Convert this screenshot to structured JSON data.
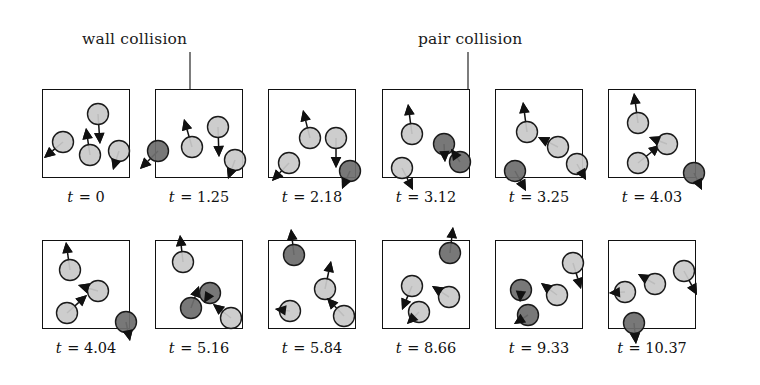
{
  "figure": {
    "type": "simulation-snapshot-sequence",
    "rows": 2,
    "columns": 6,
    "box": {
      "width": 88,
      "height": 89,
      "border_color": "#111111",
      "border_width": 1.6
    },
    "particle": {
      "radius": 10.5,
      "normal_fill": "#c9c9c9",
      "collision_fill": "#6e6e6e",
      "outline_color": "#1a1a1a",
      "outline_width": 1.4,
      "arrow_color": "#111111"
    }
  },
  "annotations": [
    {
      "id": "wall-collision",
      "label": "wall collision",
      "x": 82,
      "y": 30,
      "leader_x": 190,
      "leader_y_top": 52,
      "leader_y_bottom": 112
    },
    {
      "id": "pair-collision",
      "label": "pair collision",
      "x": 418,
      "y": 30,
      "leader_x": 468,
      "leader_y_top": 52,
      "leader_y_bottom": 142
    }
  ],
  "panels": [
    {
      "id": "panel-1",
      "time_label": "t = 0",
      "time_prefix": "t",
      "time_value": "= 0",
      "x": 42,
      "y": 89,
      "particles": [
        {
          "cx": 21,
          "cy": 53,
          "state": "normal",
          "arrow": {
            "dx": -19,
            "dy": 16
          }
        },
        {
          "cx": 48,
          "cy": 66,
          "state": "normal",
          "arrow": {
            "dx": -4,
            "dy": -27
          }
        },
        {
          "cx": 77,
          "cy": 62,
          "state": "normal",
          "arrow": {
            "dx": -6,
            "dy": 19
          }
        },
        {
          "cx": 56,
          "cy": 25,
          "state": "normal",
          "arrow": {
            "dx": 2,
            "dy": 30
          }
        }
      ]
    },
    {
      "id": "panel-2",
      "time_label": "t = 1.25",
      "time_prefix": "t",
      "time_value": "= 1.25",
      "x": 155,
      "y": 89,
      "particles": [
        {
          "cx": 3,
          "cy": 62,
          "state": "collision",
          "arrow": {
            "dx": -18,
            "dy": 18
          }
        },
        {
          "cx": 37,
          "cy": 58,
          "state": "normal",
          "arrow": {
            "dx": -8,
            "dy": -28
          }
        },
        {
          "cx": 63,
          "cy": 38,
          "state": "normal",
          "arrow": {
            "dx": 1,
            "dy": 30
          }
        },
        {
          "cx": 80,
          "cy": 71,
          "state": "normal",
          "arrow": {
            "dx": -7,
            "dy": 19
          }
        }
      ]
    },
    {
      "id": "panel-3",
      "time_label": "t = 2.18",
      "time_prefix": "t",
      "time_value": "= 2.18",
      "x": 268,
      "y": 89,
      "particles": [
        {
          "cx": 21,
          "cy": 74,
          "state": "normal",
          "arrow": {
            "dx": -17,
            "dy": 18
          }
        },
        {
          "cx": 42,
          "cy": 49,
          "state": "normal",
          "arrow": {
            "dx": -7,
            "dy": -28
          }
        },
        {
          "cx": 68,
          "cy": 49,
          "state": "normal",
          "arrow": {
            "dx": 0,
            "dy": 30
          }
        },
        {
          "cx": 82,
          "cy": 82,
          "state": "collision",
          "arrow": {
            "dx": -8,
            "dy": 18
          }
        }
      ]
    },
    {
      "id": "panel-4",
      "time_label": "t = 3.12",
      "time_prefix": "t",
      "time_value": "= 3.12",
      "x": 382,
      "y": 89,
      "particles": [
        {
          "cx": 30,
          "cy": 45,
          "state": "normal",
          "arrow": {
            "dx": -4,
            "dy": -30
          }
        },
        {
          "cx": 20,
          "cy": 79,
          "state": "normal",
          "arrow": {
            "dx": 11,
            "dy": 22
          }
        },
        {
          "cx": 62,
          "cy": 55,
          "state": "collision",
          "arrow": {
            "dx": 1,
            "dy": 18
          }
        },
        {
          "cx": 78,
          "cy": 73,
          "state": "collision",
          "arrow": {
            "dx": -9,
            "dy": -13
          }
        }
      ]
    },
    {
      "id": "panel-5",
      "time_label": "t = 3.25",
      "time_prefix": "t",
      "time_value": "= 3.25",
      "x": 495,
      "y": 89,
      "particles": [
        {
          "cx": 32,
          "cy": 43,
          "state": "normal",
          "arrow": {
            "dx": -4,
            "dy": -30
          }
        },
        {
          "cx": 20,
          "cy": 82,
          "state": "collision",
          "arrow": {
            "dx": 11,
            "dy": 20
          }
        },
        {
          "cx": 63,
          "cy": 58,
          "state": "normal",
          "arrow": {
            "dx": -20,
            "dy": -10
          }
        },
        {
          "cx": 82,
          "cy": 75,
          "state": "normal",
          "arrow": {
            "dx": 9,
            "dy": 16
          }
        }
      ]
    },
    {
      "id": "panel-6",
      "time_label": "t = 4.03",
      "time_prefix": "t",
      "time_value": "= 4.03",
      "x": 608,
      "y": 89,
      "particles": [
        {
          "cx": 30,
          "cy": 34,
          "state": "normal",
          "arrow": {
            "dx": -4,
            "dy": -30
          }
        },
        {
          "cx": 30,
          "cy": 74,
          "state": "normal",
          "arrow": {
            "dx": 22,
            "dy": -18
          }
        },
        {
          "cx": 59,
          "cy": 55,
          "state": "normal",
          "arrow": {
            "dx": -18,
            "dy": -7
          }
        },
        {
          "cx": 86,
          "cy": 84,
          "state": "collision",
          "arrow": {
            "dx": 8,
            "dy": 17
          }
        }
      ]
    },
    {
      "id": "panel-7",
      "time_label": "t = 4.04",
      "time_prefix": "t",
      "time_value": "= 4.04",
      "x": 42,
      "y": 240,
      "particles": [
        {
          "cx": 28,
          "cy": 30,
          "state": "normal",
          "arrow": {
            "dx": -4,
            "dy": -28
          }
        },
        {
          "cx": 25,
          "cy": 73,
          "state": "normal",
          "arrow": {
            "dx": 20,
            "dy": -18
          }
        },
        {
          "cx": 56,
          "cy": 51,
          "state": "normal",
          "arrow": {
            "dx": -20,
            "dy": -6
          }
        },
        {
          "cx": 84,
          "cy": 82,
          "state": "collision",
          "arrow": {
            "dx": 4,
            "dy": 19
          }
        }
      ]
    },
    {
      "id": "panel-8",
      "time_label": "t = 5.16",
      "time_prefix": "t",
      "time_value": "= 5.16",
      "x": 155,
      "y": 240,
      "particles": [
        {
          "cx": 28,
          "cy": 22,
          "state": "normal",
          "arrow": {
            "dx": -3,
            "dy": -27
          }
        },
        {
          "cx": 36,
          "cy": 68,
          "state": "collision",
          "arrow": {
            "dx": 8,
            "dy": -22
          }
        },
        {
          "cx": 55,
          "cy": 53,
          "state": "collision",
          "arrow": {
            "dx": -6,
            "dy": 10
          }
        },
        {
          "cx": 76,
          "cy": 78,
          "state": "normal",
          "arrow": {
            "dx": -18,
            "dy": -14
          }
        }
      ]
    },
    {
      "id": "panel-9",
      "time_label": "t = 5.84",
      "time_prefix": "t",
      "time_value": "= 5.84",
      "x": 268,
      "y": 240,
      "particles": [
        {
          "cx": 26,
          "cy": 15,
          "state": "collision",
          "arrow": {
            "dx": -3,
            "dy": -26
          }
        },
        {
          "cx": 22,
          "cy": 71,
          "state": "normal",
          "arrow": {
            "dx": -15,
            "dy": -2
          }
        },
        {
          "cx": 57,
          "cy": 49,
          "state": "normal",
          "arrow": {
            "dx": 6,
            "dy": -28
          }
        },
        {
          "cx": 76,
          "cy": 76,
          "state": "normal",
          "arrow": {
            "dx": -17,
            "dy": -18
          }
        }
      ]
    },
    {
      "id": "panel-10",
      "time_label": "t = 8.66",
      "time_prefix": "t",
      "time_value": "= 8.66",
      "x": 382,
      "y": 240,
      "particles": [
        {
          "cx": 68,
          "cy": 13,
          "state": "collision",
          "arrow": {
            "dx": 3,
            "dy": -26
          }
        },
        {
          "cx": 30,
          "cy": 46,
          "state": "normal",
          "arrow": {
            "dx": -10,
            "dy": 24
          }
        },
        {
          "cx": 37,
          "cy": 72,
          "state": "normal",
          "arrow": {
            "dx": -12,
            "dy": 12
          }
        },
        {
          "cx": 67,
          "cy": 57,
          "state": "normal",
          "arrow": {
            "dx": -17,
            "dy": -11
          }
        }
      ]
    },
    {
      "id": "panel-11",
      "time_label": "t = 9.33",
      "time_prefix": "t",
      "time_value": "= 9.33",
      "x": 495,
      "y": 240,
      "particles": [
        {
          "cx": 78,
          "cy": 23,
          "state": "normal",
          "arrow": {
            "dx": 8,
            "dy": 26
          }
        },
        {
          "cx": 62,
          "cy": 55,
          "state": "normal",
          "arrow": {
            "dx": -16,
            "dy": -12
          }
        },
        {
          "cx": 26,
          "cy": 50,
          "state": "collision",
          "arrow": {
            "dx": -1,
            "dy": 12
          }
        },
        {
          "cx": 33,
          "cy": 75,
          "state": "collision",
          "arrow": {
            "dx": -14,
            "dy": 9
          }
        }
      ]
    },
    {
      "id": "panel-12",
      "time_label": "t = 10.37",
      "time_prefix": "t",
      "time_value": "= 10.37",
      "x": 608,
      "y": 240,
      "particles": [
        {
          "cx": 76,
          "cy": 31,
          "state": "normal",
          "arrow": {
            "dx": 13,
            "dy": 24
          }
        },
        {
          "cx": 47,
          "cy": 44,
          "state": "normal",
          "arrow": {
            "dx": -17,
            "dy": -10
          }
        },
        {
          "cx": 17,
          "cy": 52,
          "state": "normal",
          "arrow": {
            "dx": -16,
            "dy": 1
          }
        },
        {
          "cx": 26,
          "cy": 83,
          "state": "collision",
          "arrow": {
            "dx": 2,
            "dy": 21
          }
        }
      ]
    }
  ]
}
